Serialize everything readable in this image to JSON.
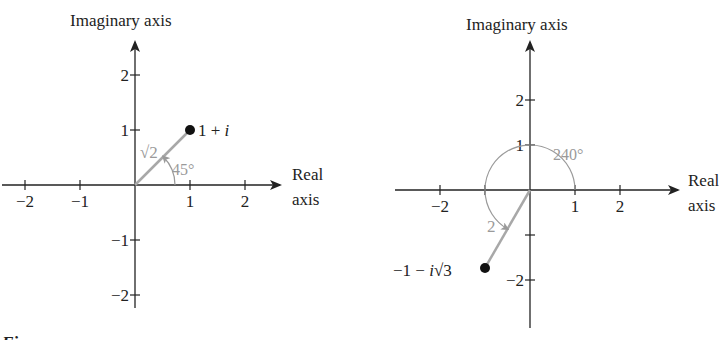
{
  "colors": {
    "axis": "#222222",
    "vector": "#a8a8a8",
    "point": "#111111",
    "annotation": "#9a9a9a"
  },
  "panels": [
    {
      "id": "left",
      "y_axis_label": "Imaginary axis",
      "x_axis_label_line1": "Real",
      "x_axis_label_line2": "axis",
      "x_ticks": [
        {
          "value": -2,
          "label": "−2"
        },
        {
          "value": -1,
          "label": "−1"
        },
        {
          "value": 1,
          "label": "1"
        },
        {
          "value": 2,
          "label": "2"
        }
      ],
      "y_ticks": [
        {
          "value": 2,
          "label": "2"
        },
        {
          "value": 1,
          "label": "1"
        },
        {
          "value": -1,
          "label": "−1"
        },
        {
          "value": -2,
          "label": "−2"
        }
      ],
      "point": {
        "re": 1,
        "im": 1,
        "label_main": "1 + ",
        "label_italic": "i"
      },
      "modulus_label": "√2",
      "angle_deg": 45,
      "angle_label": "45°"
    },
    {
      "id": "right",
      "y_axis_label": "Imaginary axis",
      "x_axis_label_line1": "Real",
      "x_axis_label_line2": "axis",
      "x_ticks": [
        {
          "value": -2,
          "label": "−2"
        },
        {
          "value": -1,
          "label": ""
        },
        {
          "value": 1,
          "label": "1"
        },
        {
          "value": 2,
          "label": "2"
        }
      ],
      "y_ticks": [
        {
          "value": 2,
          "label": "2"
        },
        {
          "value": 1,
          "label": "1"
        },
        {
          "value": -1,
          "label": ""
        },
        {
          "value": -2,
          "label": "−2"
        }
      ],
      "point": {
        "re": -1,
        "im": -1.732,
        "label_pre": "−1 − ",
        "label_italic": "i",
        "label_post": "√3"
      },
      "modulus_label": "2",
      "angle_deg": 240,
      "angle_label": "240°"
    }
  ],
  "caption_partial": "Figure"
}
